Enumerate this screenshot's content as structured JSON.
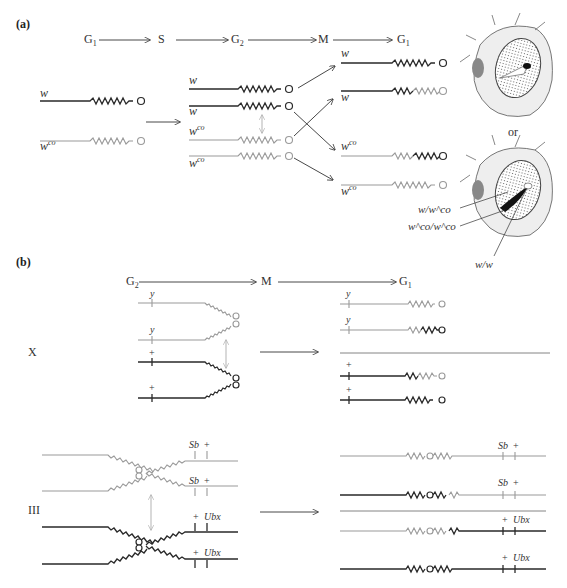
{
  "figure": {
    "panels": {
      "a": {
        "label": "(a)",
        "cell_cycle": [
          "G1",
          "S",
          "G2",
          "M",
          "G1"
        ],
        "stage_labels": {
          "g1_start": "G",
          "g1_sub": "1",
          "s": "S",
          "g2": "G",
          "g2_sub": "2",
          "m": "M",
          "g1_end": "G",
          "g1_end_sub": "1"
        },
        "g1_chromosomes": [
          {
            "allele": "w",
            "superscript": "",
            "shade": "dark"
          },
          {
            "allele": "w",
            "superscript": "co",
            "shade": "light"
          }
        ],
        "g2_chromatids": [
          {
            "allele": "w",
            "superscript": "",
            "shade": "dark"
          },
          {
            "allele": "w",
            "superscript": "",
            "shade": "dark"
          },
          {
            "allele": "w",
            "superscript": "co",
            "shade": "light"
          },
          {
            "allele": "w",
            "superscript": "co",
            "shade": "light"
          }
        ],
        "daughter_chromosomes": [
          {
            "allele": "w",
            "superscript": "",
            "shade": "dark"
          },
          {
            "allele": "w",
            "superscript": "",
            "shade": "dark-light"
          },
          {
            "allele": "w",
            "superscript": "co",
            "shade": "light-dark"
          },
          {
            "allele": "w",
            "superscript": "co",
            "shade": "light"
          }
        ],
        "separator": "or",
        "eye_labels": [
          {
            "base": "w/w",
            "sup": "co",
            "text": "w/w^co"
          },
          {
            "text": "w^co/w^co"
          },
          {
            "text": "w/w"
          }
        ]
      },
      "b": {
        "label": "(b)",
        "cell_cycle": [
          "G2",
          "M",
          "G1"
        ],
        "stage_labels": {
          "g2": "G",
          "g2_sub": "2",
          "m": "M",
          "g1": "G",
          "g1_sub": "1"
        },
        "x_chromosome": {
          "label": "X",
          "g2_markers": [
            "y",
            "y",
            "+",
            "+"
          ],
          "g1_markers": [
            "y",
            "y",
            "+",
            "+"
          ]
        },
        "third_chromosome": {
          "label": "III",
          "g2_markers": [
            [
              "Sb",
              "+"
            ],
            [
              "Sb",
              "+"
            ],
            [
              "+",
              "Ubx"
            ],
            [
              "+",
              "Ubx"
            ]
          ],
          "g1_markers": [
            [
              "Sb",
              "+"
            ],
            [
              "Sb",
              "+"
            ],
            [
              "+",
              "Ubx"
            ],
            [
              "+",
              "Ubx"
            ]
          ]
        }
      }
    },
    "colors": {
      "dark_chromosome": "#2a2a2a",
      "light_chromosome": "#9a9a9a",
      "background": "#ffffff"
    }
  }
}
